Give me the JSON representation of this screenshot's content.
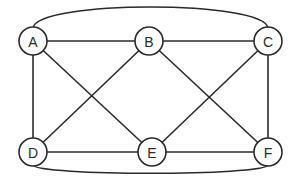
{
  "diagram": {
    "type": "graph",
    "directed": false,
    "node_radius": 14,
    "stroke_color": "#2a2a2a",
    "background": "#ffffff",
    "nodes": [
      {
        "id": "A",
        "label": "A",
        "x": 33,
        "y": 41
      },
      {
        "id": "B",
        "label": "B",
        "x": 149,
        "y": 41
      },
      {
        "id": "C",
        "label": "C",
        "x": 268,
        "y": 41
      },
      {
        "id": "D",
        "label": "D",
        "x": 33,
        "y": 152
      },
      {
        "id": "E",
        "label": "E",
        "x": 152,
        "y": 152
      },
      {
        "id": "F",
        "label": "F",
        "x": 268,
        "y": 152
      }
    ],
    "edges": [
      {
        "from": "A",
        "to": "B",
        "shape": "straight"
      },
      {
        "from": "B",
        "to": "C",
        "shape": "straight"
      },
      {
        "from": "A",
        "to": "D",
        "shape": "straight"
      },
      {
        "from": "C",
        "to": "F",
        "shape": "straight"
      },
      {
        "from": "D",
        "to": "E",
        "shape": "straight"
      },
      {
        "from": "E",
        "to": "F",
        "shape": "straight"
      },
      {
        "from": "A",
        "to": "E",
        "shape": "straight"
      },
      {
        "from": "B",
        "to": "D",
        "shape": "straight"
      },
      {
        "from": "B",
        "to": "F",
        "shape": "straight"
      },
      {
        "from": "C",
        "to": "E",
        "shape": "straight"
      },
      {
        "from": "A",
        "to": "C",
        "shape": "arc-top"
      },
      {
        "from": "D",
        "to": "F",
        "shape": "arc-bottom"
      }
    ]
  }
}
